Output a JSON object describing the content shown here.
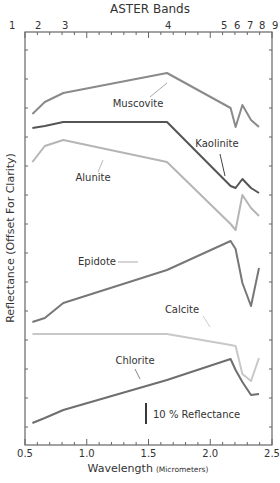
{
  "chart_data": {
    "type": "line",
    "title": "ASTER Bands",
    "xlabel": "Wavelength",
    "xlabel_unit": "(Micrometers)",
    "ylabel": "Reflectance (Offset For Clarity)",
    "xlim": [
      0.5,
      2.5
    ],
    "x_ticks": [
      "0.5",
      "1.0",
      "1.5",
      "2.0",
      "2.5"
    ],
    "x_tick_values": [
      0.5,
      1.0,
      1.5,
      2.0,
      2.5
    ],
    "top_axis_bands": [
      {
        "label": "1",
        "x": 0.556
      },
      {
        "label": "2",
        "x": 0.661
      },
      {
        "label": "3",
        "x": 0.807
      },
      {
        "label": "4",
        "x": 1.656
      },
      {
        "label": "5",
        "x": 2.167
      },
      {
        "label": "6",
        "x": 2.209
      },
      {
        "label": "7",
        "x": 2.262
      },
      {
        "label": "8",
        "x": 2.336
      },
      {
        "label": "9",
        "x": 2.4
      }
    ],
    "scale_bar": {
      "label": "10 % Reflectance",
      "value": 10
    },
    "grid": false,
    "legend": "inline labels",
    "x": [
      0.56,
      0.66,
      0.81,
      1.65,
      2.165,
      2.205,
      2.26,
      2.33,
      2.395
    ],
    "series": [
      {
        "name": "Muscovite",
        "color": "#8a8a8a",
        "y_px": [
          114,
          102,
          93,
          73,
          108,
          127,
          105,
          120,
          127
        ],
        "label_pos": [
          138,
          107
        ]
      },
      {
        "name": "Kaolinite",
        "color": "#555555",
        "y_px": [
          128,
          126,
          122,
          122,
          186,
          188,
          179,
          188,
          193
        ],
        "label_pos": [
          217,
          147
        ]
      },
      {
        "name": "Alunite",
        "color": "#b5b5b5",
        "y_px": [
          162,
          146,
          140,
          162,
          224,
          230,
          195,
          208,
          216
        ],
        "label_pos": [
          93,
          181
        ]
      },
      {
        "name": "Epidote",
        "color": "#777777",
        "y_px": [
          322,
          318,
          303,
          270,
          241,
          249,
          283,
          306,
          268
        ],
        "label_pos": [
          97,
          265
        ]
      },
      {
        "name": "Calcite",
        "color": "#c8c8c8",
        "y_px": [
          334,
          334,
          334,
          334,
          345,
          346,
          374,
          381,
          358
        ],
        "label_pos": [
          182,
          313
        ]
      },
      {
        "name": "Chlorite",
        "color": "#6e6e6e",
        "y_px": [
          423,
          418,
          410,
          380,
          359,
          370,
          382,
          395,
          394
        ],
        "label_pos": [
          135,
          364
        ]
      }
    ]
  }
}
